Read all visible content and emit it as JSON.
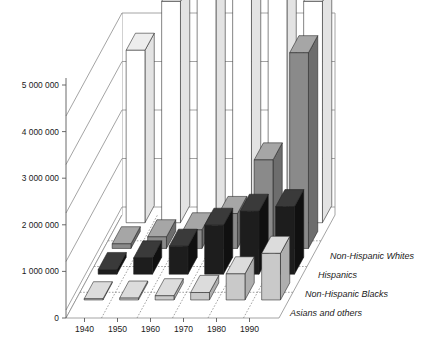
{
  "chart_data": {
    "type": "bar",
    "title": "",
    "subtitle": "",
    "xlabel": "",
    "ylabel": "",
    "ylim": [
      0,
      6000000
    ],
    "grid": true,
    "legend_position": "right-inline-3d",
    "projection": "3d-bar",
    "categories": [
      "1940",
      "1950",
      "1960",
      "1970",
      "1980",
      "1990"
    ],
    "ytick_labels": [
      "0",
      "1 000 000",
      "2 000 000",
      "3 000 000",
      "4 000 000",
      "5 000 000"
    ],
    "ytick_values": [
      0,
      1000000,
      2000000,
      3000000,
      4000000,
      5000000
    ],
    "series": [
      {
        "name": "Non-Hispanic Whites",
        "color": "#ffffff",
        "side_color": "#e3e3e3",
        "top_color": "#ededed",
        "row": 0,
        "values": [
          3700000,
          4750000,
          5850000,
          5700000,
          5100000,
          4750000
        ]
      },
      {
        "name": "Hispanics",
        "color": "#8a8a8a",
        "side_color": "#6d6d6d",
        "top_color": "#a6a6a6",
        "row": 1,
        "values": [
          100000,
          250000,
          400000,
          750000,
          1900000,
          4200000
        ]
      },
      {
        "name": "Non-Hispanic Blacks",
        "color": "#1d1d1d",
        "side_color": "#101010",
        "top_color": "#3a3a3a",
        "row": 2,
        "values": [
          100000,
          350000,
          600000,
          1050000,
          1350000,
          1450000
        ]
      },
      {
        "name": "Asians and others",
        "color": "#c9c9c9",
        "side_color": "#aeaeae",
        "top_color": "#dcdcdc",
        "row": 3,
        "values": [
          25000,
          40000,
          90000,
          160000,
          560000,
          1000000
        ]
      }
    ]
  },
  "axes": {
    "y_tick_labels": [
      "5 000 000",
      "4 000 000",
      "3 000 000",
      "2 000 000",
      "1 000 000",
      "0"
    ],
    "x_tick_labels": [
      "1940",
      "1950",
      "1960",
      "1970",
      "1980",
      "1990"
    ]
  },
  "series_labels": [
    "Non-Hispanic Whites",
    "Hispanics",
    "Non-Hispanic Blacks",
    "Asians and others"
  ],
  "colors": {
    "whites": "#ffffff",
    "hispanics": "#8a8a8a",
    "blacks": "#1d1d1d",
    "asians": "#c9c9c9",
    "grid": "#8d8d8d",
    "axis": "#5a5a5a",
    "text": "#1a1a1a"
  }
}
